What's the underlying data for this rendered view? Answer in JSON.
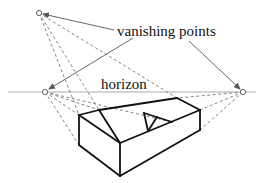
{
  "diagram": {
    "labels": {
      "vanishing_points": "vanishing points",
      "horizon": "horizon"
    },
    "colors": {
      "background": "#ffffff",
      "solid_edge": "#111111",
      "construction_line": "#777777",
      "horizon_line": "#aaaaaa",
      "annotation_arrow": "#555555"
    },
    "vanishing_points": [
      {
        "name": "top",
        "x": 39,
        "y": 13
      },
      {
        "name": "left",
        "x": 45,
        "y": 92
      },
      {
        "name": "right",
        "x": 243,
        "y": 92
      }
    ],
    "horizon": {
      "x1": 8,
      "x2": 256,
      "y": 92
    },
    "object": {
      "kind": "wedge-shaped block with triangular notch",
      "vertices": {
        "left_top": [
          79,
          115
        ],
        "left_bottom": [
          79,
          145
        ],
        "front_top": [
          120,
          143
        ],
        "front_bottom": [
          120,
          176
        ],
        "ridge_left": [
          99,
          110
        ],
        "back_top": [
          177,
          98
        ],
        "right_top": [
          200,
          110
        ],
        "right_bottom": [
          200,
          130
        ],
        "notch_a": [
          144,
          113
        ],
        "notch_b": [
          148,
          131
        ],
        "notch_c": [
          172,
          122
        ]
      }
    }
  }
}
